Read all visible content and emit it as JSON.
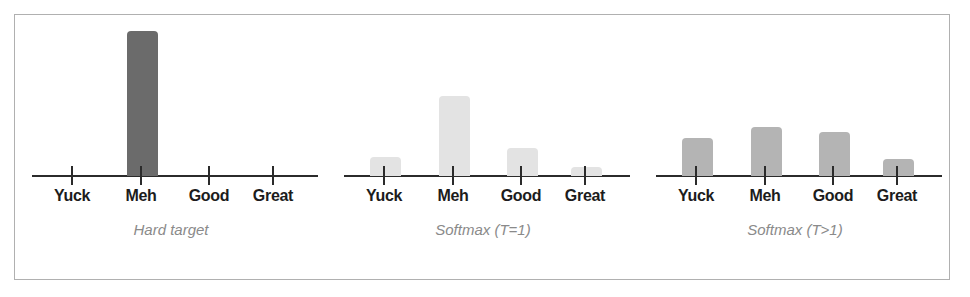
{
  "figure": {
    "background_color": "#ffffff",
    "border_color": "#b0b0b0",
    "axis_color": "#2b2b2b",
    "label_color": "#1c1c1c",
    "caption_color": "#8a8a8a"
  },
  "chart_data": {
    "type": "bar",
    "title": "",
    "xlabel": "",
    "ylabel": "",
    "grid": false,
    "legend": "none",
    "categories": [
      "Yuck",
      "Meh",
      "Good",
      "Great"
    ],
    "ylim": [
      0,
      1
    ],
    "panels": [
      {
        "caption": "Hard target",
        "bar_color": "#6b6b6b",
        "values": [
          0.0,
          1.0,
          0.0,
          0.0
        ]
      },
      {
        "caption": "Softmax (T=1)",
        "bar_color": "#e3e3e3",
        "values": [
          0.13,
          0.55,
          0.19,
          0.06
        ]
      },
      {
        "caption": "Softmax (T>1)",
        "bar_color": "#b4b4b4",
        "values": [
          0.26,
          0.34,
          0.3,
          0.12
        ]
      }
    ]
  }
}
